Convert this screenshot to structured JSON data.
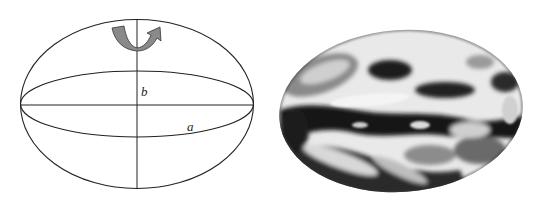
{
  "figure": {
    "left": {
      "description": "Oblate ellipsoid of revolution with rotation arrow",
      "labels": {
        "semi_minor": "b",
        "semi_major": "a"
      },
      "colors": {
        "stroke": "#222222",
        "arrow_fill": "#8a8a8a",
        "arrow_stroke": "#333333"
      }
    },
    "right": {
      "description": "Grayscale satellite image of Earth rendered as an ellipsoid",
      "colors": {
        "dark": "#111111",
        "mid": "#7a7a7a",
        "light": "#f2f2f2"
      }
    }
  }
}
